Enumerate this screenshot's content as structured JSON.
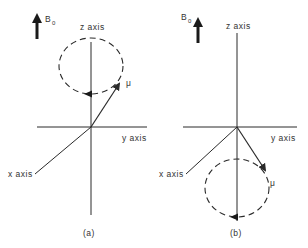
{
  "panels": [
    {
      "id": "a",
      "caption": "(a)",
      "field_label": "B",
      "field_subscript": "0",
      "z_label": "z axis",
      "y_label": "y axis",
      "x_label": "x axis",
      "moment_label": "μ",
      "precession": "above xy-plane"
    },
    {
      "id": "b",
      "caption": "(b)",
      "field_label": "B",
      "field_subscript": "0",
      "z_label": "z axis",
      "y_label": "y axis",
      "x_label": "x axis",
      "moment_label": "μ",
      "precession": "below xy-plane"
    }
  ],
  "colors": {
    "line": "#2a2a2a",
    "text": "#333333"
  }
}
